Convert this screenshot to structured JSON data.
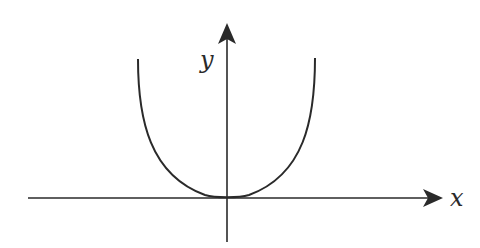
{
  "diagram": {
    "title": "",
    "x_axis_label": "x",
    "y_axis_label": "y",
    "curve": "U-shaped curve with minimum at origin (even function, e.g. y = x^4)",
    "colors": {
      "stroke": "#2a2a2a",
      "background": "#ffffff"
    }
  }
}
